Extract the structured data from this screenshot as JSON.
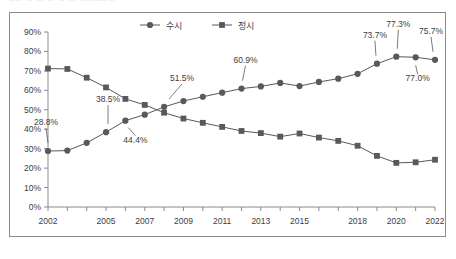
{
  "top_clipped_text": "■■ ■ ■ ■ ■ ■ ■■■■■",
  "colors": {
    "series_sushi": "#595959",
    "series_jeongsi": "#595959",
    "axis": "#8c8c8c",
    "text": "#404040",
    "frame_border": "#8c8c8c",
    "background": "#ffffff"
  },
  "legend": {
    "position": "top-center",
    "entries": [
      {
        "label": "수시",
        "marker": "circle",
        "color": "#595959"
      },
      {
        "label": "정시",
        "marker": "square",
        "color": "#595959"
      }
    ]
  },
  "axes": {
    "y_ticks": [
      "0%",
      "10%",
      "20%",
      "30%",
      "40%",
      "50%",
      "60%",
      "70%",
      "80%",
      "90%"
    ],
    "x_ticks_labeled": [
      "2002",
      "2005",
      "2007",
      "2009",
      "2011",
      "2013",
      "2015",
      "2018",
      "2020",
      "2022"
    ]
  },
  "chart_data": {
    "type": "line",
    "title": "",
    "subtitle": "",
    "xlabel": "",
    "ylabel": "",
    "ylim": [
      0,
      90
    ],
    "grid": false,
    "legend_position": "top-center",
    "categories": [
      "2002",
      "2003",
      "2004",
      "2005",
      "2006",
      "2007",
      "2008",
      "2009",
      "2010",
      "2011",
      "2012",
      "2013",
      "2014",
      "2015",
      "2016",
      "2017",
      "2018",
      "2019",
      "2020",
      "2021",
      "2022"
    ],
    "tick_labels": [
      "2002",
      "",
      "",
      "2005",
      "",
      "2007",
      "",
      "2009",
      "",
      "2011",
      "",
      "2013",
      "",
      "2015",
      "",
      "",
      "2018",
      "",
      "2020",
      "",
      "2022"
    ],
    "series": [
      {
        "name": "수시",
        "marker": "circle",
        "color": "#595959",
        "values": [
          28.8,
          29.0,
          33.0,
          38.5,
          44.4,
          47.5,
          51.5,
          54.5,
          56.7,
          58.8,
          60.9,
          62.0,
          63.8,
          62.2,
          64.3,
          66.0,
          68.5,
          73.7,
          77.3,
          77.0,
          75.7
        ],
        "point_labels": [
          "28.8%",
          "",
          "",
          "38.5%",
          "44.4%",
          "",
          "51.5%",
          "",
          "",
          "",
          "60.9%",
          "",
          "",
          "",
          "",
          "",
          "",
          "73.7%",
          "77.3%",
          "77.0%",
          "75.7%"
        ]
      },
      {
        "name": "정시",
        "marker": "square",
        "color": "#595959",
        "values": [
          71.2,
          71.0,
          66.5,
          61.5,
          55.6,
          52.5,
          48.5,
          45.5,
          43.3,
          41.2,
          39.1,
          38.0,
          36.2,
          37.8,
          35.7,
          34.0,
          31.5,
          26.3,
          22.7,
          23.0,
          24.3
        ],
        "point_labels": [
          "",
          "",
          "",
          "",
          "",
          "",
          "",
          "",
          "",
          "",
          "",
          "",
          "",
          "",
          "",
          "",
          "",
          "",
          "",
          "",
          ""
        ]
      }
    ]
  }
}
